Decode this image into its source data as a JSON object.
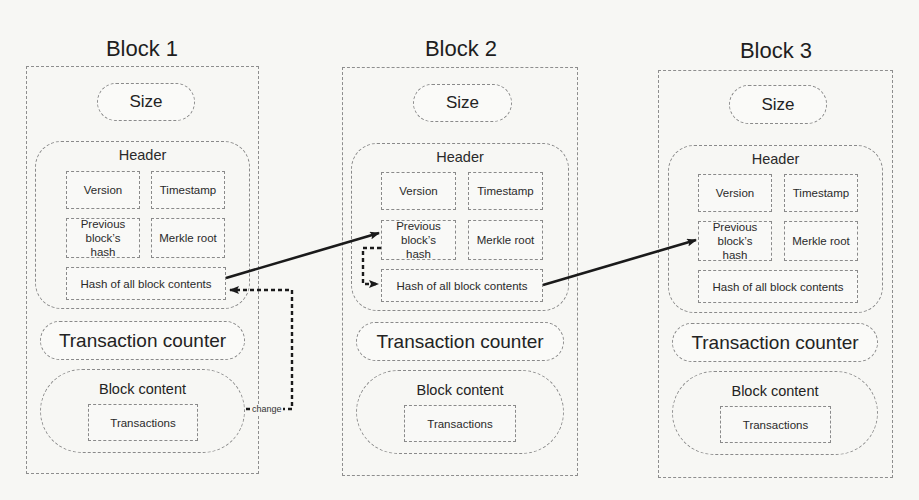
{
  "diagram": {
    "type": "blockchain-structure",
    "blocks": [
      {
        "title": "Block 1",
        "size_label": "Size",
        "header": {
          "label": "Header",
          "fields": {
            "version": "Version",
            "timestamp": "Timestamp",
            "previous_hash": "Previous block’s hash",
            "merkle_root": "Merkle root",
            "hash_all": "Hash of all block contents"
          }
        },
        "transaction_counter": "Transaction counter",
        "block_content": {
          "label": "Block content",
          "transactions": "Transactions"
        }
      },
      {
        "title": "Block 2",
        "size_label": "Size",
        "header": {
          "label": "Header",
          "fields": {
            "version": "Version",
            "timestamp": "Timestamp",
            "previous_hash": "Previous block’s hash",
            "merkle_root": "Merkle root",
            "hash_all": "Hash of all block contents"
          }
        },
        "transaction_counter": "Transaction counter",
        "block_content": {
          "label": "Block content",
          "transactions": "Transactions"
        }
      },
      {
        "title": "Block 3",
        "size_label": "Size",
        "header": {
          "label": "Header",
          "fields": {
            "version": "Version",
            "timestamp": "Timestamp",
            "previous_hash": "Previous block’s hash",
            "merkle_root": "Merkle root",
            "hash_all": "Hash of all block contents"
          }
        },
        "transaction_counter": "Transaction counter",
        "block_content": {
          "label": "Block content",
          "transactions": "Transactions"
        }
      }
    ],
    "connections": [
      {
        "from": "Block 1 / Hash of all block contents",
        "to": "Block 2 / Previous block’s hash",
        "style": "solid"
      },
      {
        "from": "Block 2 / Previous block’s hash",
        "to": "Block 2 / Hash of all block contents",
        "style": "dashed"
      },
      {
        "from": "Block 2 / Hash of all block contents",
        "to": "Block 3 / Previous block’s hash",
        "style": "solid"
      },
      {
        "from": "Block 1 / Block content",
        "to": "Block 1 / Hash of all block contents",
        "style": "dashed",
        "label": "change"
      }
    ],
    "change_label": "change",
    "colors": {
      "background": "#f7f7f4",
      "border": "#8a8a8a",
      "arrow": "#1a1a1a",
      "text": "#2a2a2a"
    }
  }
}
